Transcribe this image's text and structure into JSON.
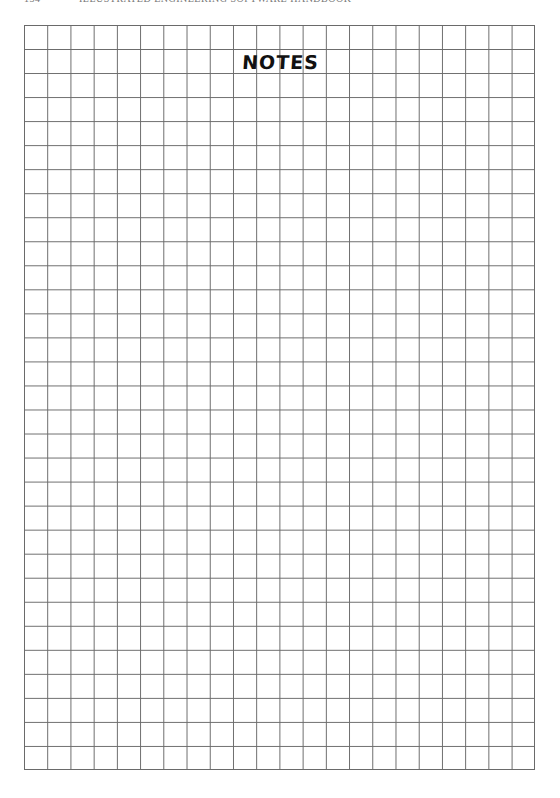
{
  "running_head": {
    "page_number": "134",
    "title": "ILLUSTRATED ENGINEERING SOFTWARE HANDBOOK"
  },
  "notes": {
    "title": "NOTES"
  },
  "grid": {
    "columns": 22,
    "rows": 31
  }
}
